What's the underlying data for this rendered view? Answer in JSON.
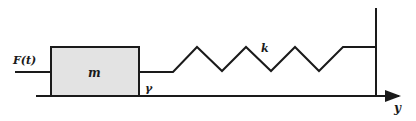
{
  "diagram": {
    "type": "mass-spring-damper",
    "labels": {
      "force": "F(t)",
      "mass": "m",
      "damping": "γ",
      "spring": "k",
      "displacement_axis": "y"
    },
    "colors": {
      "stroke": "#1a1a1a",
      "mass_fill": "#e3e3e3",
      "background": "#ffffff"
    }
  }
}
